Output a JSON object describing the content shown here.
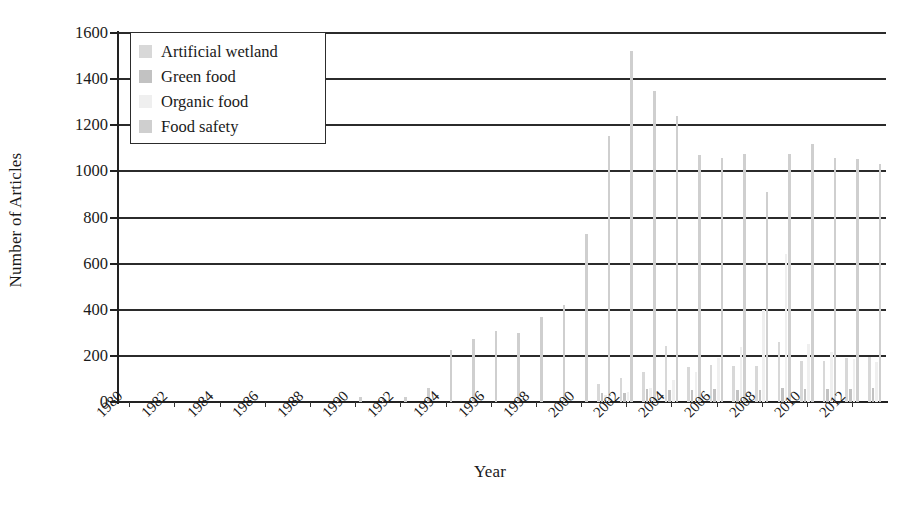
{
  "chart_data": {
    "type": "bar",
    "title": "",
    "subtitle": "",
    "xlabel": "Year",
    "ylabel": "Number of Articles",
    "ylim": [
      0,
      1600
    ],
    "ytick_step": 200,
    "yticks": [
      0,
      200,
      400,
      600,
      800,
      1000,
      1200,
      1400,
      1600
    ],
    "grid": true,
    "grid_axis": "y",
    "legend_position": "upper-left",
    "x": [
      1980,
      1981,
      1982,
      1983,
      1984,
      1985,
      1986,
      1987,
      1988,
      1989,
      1990,
      1991,
      1992,
      1993,
      1994,
      1995,
      1996,
      1997,
      1998,
      1999,
      2000,
      2001,
      2002,
      2003,
      2004,
      2005,
      2006,
      2007,
      2008,
      2009,
      2010,
      2011,
      2012,
      2013
    ],
    "xtick_labels": [
      "1980",
      "1982",
      "1984",
      "1986",
      "1988",
      "1990",
      "1992",
      "1994",
      "1996",
      "1998",
      "2000",
      "2002",
      "2004",
      "2006",
      "2008",
      "2010",
      "2012"
    ],
    "xtick_years": [
      1980,
      1982,
      1984,
      1986,
      1988,
      1990,
      1992,
      1994,
      1996,
      1998,
      2000,
      2002,
      2004,
      2006,
      2008,
      2010,
      2012
    ],
    "series": [
      {
        "name": "Artificial wetland",
        "color": "#d8d8d8",
        "values": [
          0,
          0,
          0,
          0,
          0,
          0,
          0,
          0,
          0,
          0,
          0,
          0,
          0,
          0,
          0,
          0,
          0,
          0,
          0,
          0,
          0,
          80,
          105,
          130,
          245,
          150,
          160,
          155,
          155,
          260,
          180,
          180,
          190,
          195
        ]
      },
      {
        "name": "Green food",
        "color": "#c2c2c2",
        "values": [
          0,
          0,
          0,
          0,
          0,
          0,
          0,
          0,
          0,
          0,
          0,
          0,
          0,
          0,
          0,
          0,
          0,
          0,
          0,
          0,
          0,
          40,
          40,
          55,
          50,
          50,
          55,
          50,
          50,
          60,
          55,
          55,
          55,
          60
        ]
      },
      {
        "name": "Organic food",
        "color": "#efefef",
        "values": [
          0,
          0,
          0,
          0,
          0,
          0,
          0,
          0,
          0,
          0,
          0,
          0,
          0,
          0,
          0,
          0,
          0,
          0,
          0,
          0,
          0,
          30,
          45,
          60,
          95,
          130,
          190,
          240,
          400,
          640,
          250,
          215,
          185,
          175
        ]
      },
      {
        "name": "Food safety",
        "color": "#cfcfcf",
        "values": [
          0,
          0,
          0,
          0,
          0,
          0,
          0,
          0,
          0,
          18,
          20,
          20,
          20,
          60,
          225,
          275,
          310,
          300,
          370,
          420,
          730,
          1155,
          1520,
          1350,
          1240,
          1070,
          1060,
          1075,
          910,
          1075,
          1120,
          1060,
          1055,
          1030
        ]
      }
    ]
  },
  "legend": {
    "items": [
      {
        "label": "Artificial wetland",
        "color": "#d8d8d8"
      },
      {
        "label": "Green food",
        "color": "#c2c2c2"
      },
      {
        "label": "Organic food",
        "color": "#efefef"
      },
      {
        "label": "Food safety",
        "color": "#cfcfcf"
      }
    ]
  },
  "axes": {
    "y_title": "Number of Articles",
    "x_title": "Year"
  },
  "colors": {
    "axis": "#222222",
    "grid": "#2b2b2b",
    "background": "#ffffff",
    "text": "#1a1a1a"
  }
}
